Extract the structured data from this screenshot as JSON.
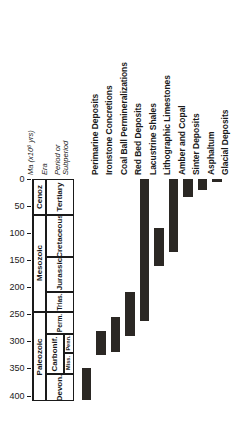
{
  "chart_data": {
    "type": "bar",
    "orientation": "vertical-range",
    "title": "",
    "ylabel": "Ma (x10⁶ yrs)",
    "xlabel": "",
    "ylim": [
      0,
      410
    ],
    "y_axis_inverted": true,
    "yticks": [
      0,
      50,
      100,
      150,
      200,
      250,
      300,
      350,
      400
    ],
    "ytick_labels": [
      "0",
      "50",
      "100",
      "150",
      "200",
      "250",
      "300",
      "350",
      "400"
    ],
    "grid": false,
    "legend": null,
    "axis_headers": {
      "ma": "Ma  (x10⁶ yrs)",
      "era": "Era",
      "period": "Period or Subperiod"
    },
    "categories": [
      "Perimarine Deposits",
      "Ironstone Concretions",
      "Coal Ball Permineralizations",
      "Red Bed Deposits",
      "Lacustrine Shales",
      "Lithographic Limestones",
      "Amber and Copal",
      "Sinter Deposits",
      "Asphaltum",
      "Glacial Deposits"
    ],
    "ranges": [
      {
        "name": "Perimarine Deposits",
        "start_ma": 348,
        "end_ma": 408
      },
      {
        "name": "Ironstone Concretions",
        "start_ma": 281,
        "end_ma": 325
      },
      {
        "name": "Coal Ball Permineralizations",
        "start_ma": 255,
        "end_ma": 318
      },
      {
        "name": "Red Bed Deposits",
        "start_ma": 208,
        "end_ma": 289
      },
      {
        "name": "Lacustrine Shales",
        "start_ma": 0,
        "end_ma": 262
      },
      {
        "name": "Lithographic Limestones",
        "start_ma": 90,
        "end_ma": 160
      },
      {
        "name": "Amber and Copal",
        "start_ma": 0,
        "end_ma": 135
      },
      {
        "name": "Sinter Deposits",
        "start_ma": 0,
        "end_ma": 33
      },
      {
        "name": "Asphaltum",
        "start_ma": 0,
        "end_ma": 20
      },
      {
        "name": "Glacial Deposits",
        "start_ma": 0,
        "end_ma": 5
      }
    ],
    "eras": [
      {
        "name": "Cenoz",
        "start_ma": 0,
        "end_ma": 66
      },
      {
        "name": "Mesozoic",
        "start_ma": 66,
        "end_ma": 245
      },
      {
        "name": "Paleozoic",
        "start_ma": 245,
        "end_ma": 410
      }
    ],
    "periods": [
      {
        "name": "Tertiary",
        "start_ma": 0,
        "end_ma": 66
      },
      {
        "name": "Cretaceous",
        "start_ma": 66,
        "end_ma": 144
      },
      {
        "name": "Jurassic",
        "start_ma": 144,
        "end_ma": 208
      },
      {
        "name": "Trias.",
        "start_ma": 208,
        "end_ma": 245
      },
      {
        "name": "Perm.",
        "start_ma": 245,
        "end_ma": 286
      },
      {
        "name": "Carbonif.",
        "start_ma": 286,
        "end_ma": 360
      },
      {
        "name": "Devon.",
        "start_ma": 360,
        "end_ma": 410
      }
    ],
    "subperiods": [
      {
        "name": "Penn.",
        "parent": "Carbonif.",
        "start_ma": 286,
        "end_ma": 320
      },
      {
        "name": "Miss.",
        "parent": "Carbonif.",
        "start_ma": 320,
        "end_ma": 360
      }
    ],
    "bar_color": "#2b2824",
    "axis_color": "#1a1a1a"
  }
}
